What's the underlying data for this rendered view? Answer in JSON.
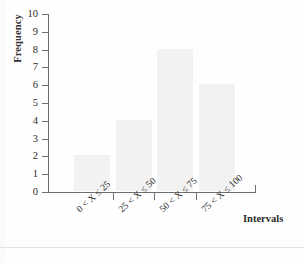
{
  "chart_data": {
    "type": "bar",
    "title": "",
    "categories": [
      "0 < X ≤ 25",
      "25 < X ≤ 50",
      "50 < X ≤ 75",
      "75 < X ≤ 100"
    ],
    "values": [
      2,
      4,
      8,
      6
    ],
    "xlabel": "Intervals",
    "ylabel": "Frequency",
    "ylim": [
      0,
      10
    ],
    "ytick_labels": [
      "0",
      "1",
      "2",
      "3",
      "4",
      "5",
      "6",
      "7",
      "8",
      "9",
      "10"
    ],
    "ytick_values": [
      0,
      1,
      2,
      3,
      4,
      5,
      6,
      7,
      8,
      9,
      10
    ],
    "grid": false,
    "legend": false,
    "bar_color": "#f2f2f2",
    "axis_color": "#6f6f6f",
    "text_color": "#2b2b2b"
  }
}
